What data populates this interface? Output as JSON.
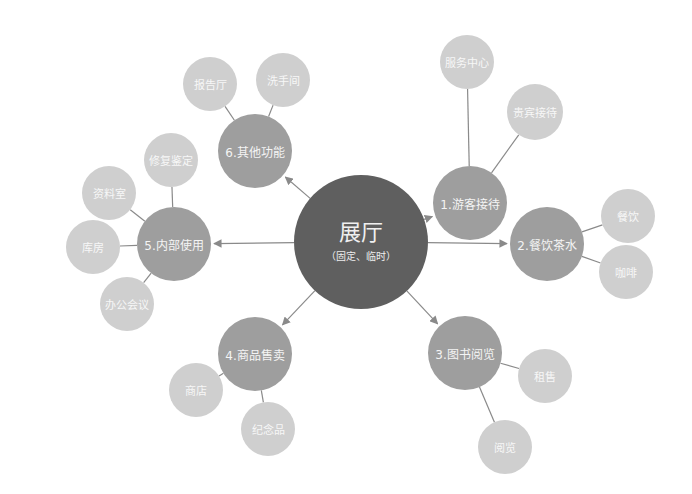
{
  "diagram": {
    "type": "mind-map",
    "colors": {
      "center": "#5f5f5f",
      "category": "#9e9e9e",
      "leaf": "#cfcfcf",
      "connector": "#8a8a8a",
      "text": "#f4f4f4"
    },
    "center": {
      "title": "展厅",
      "subtitle": "（固定、临时）",
      "x": 361,
      "y": 242,
      "r": 67
    },
    "categories": [
      {
        "label": "1.游客接待",
        "x": 470,
        "y": 203,
        "r": 37,
        "children": [
          {
            "label": "服务中心",
            "x": 467,
            "y": 62,
            "r": 27
          },
          {
            "label": "贵宾接待",
            "x": 535,
            "y": 112,
            "r": 28
          }
        ]
      },
      {
        "label": "2.餐饮茶水",
        "x": 547,
        "y": 244,
        "r": 37,
        "children": [
          {
            "label": "餐饮",
            "x": 628,
            "y": 216,
            "r": 27
          },
          {
            "label": "咖啡",
            "x": 626,
            "y": 272,
            "r": 27
          }
        ]
      },
      {
        "label": "3.图书阅览",
        "x": 465,
        "y": 353,
        "r": 37,
        "children": [
          {
            "label": "租售",
            "x": 545,
            "y": 376,
            "r": 27
          },
          {
            "label": "阅览",
            "x": 505,
            "y": 447,
            "r": 27
          }
        ]
      },
      {
        "label": "4.商品售卖",
        "x": 255,
        "y": 354,
        "r": 37,
        "children": [
          {
            "label": "商店",
            "x": 196,
            "y": 390,
            "r": 27
          },
          {
            "label": "纪念品",
            "x": 268,
            "y": 429,
            "r": 27
          }
        ]
      },
      {
        "label": "5.内部使用",
        "x": 174,
        "y": 244,
        "r": 37,
        "children": [
          {
            "label": "修复鉴定",
            "x": 171,
            "y": 160,
            "r": 27
          },
          {
            "label": "资料室",
            "x": 109,
            "y": 193,
            "r": 27
          },
          {
            "label": "库房",
            "x": 93,
            "y": 247,
            "r": 27
          },
          {
            "label": "办公会议",
            "x": 127,
            "y": 304,
            "r": 27
          }
        ]
      },
      {
        "label": "6.其他功能",
        "x": 255,
        "y": 151,
        "r": 37,
        "children": [
          {
            "label": "报告厅",
            "x": 210,
            "y": 84,
            "r": 27
          },
          {
            "label": "洗手间",
            "x": 283,
            "y": 80,
            "r": 27
          }
        ]
      }
    ]
  }
}
